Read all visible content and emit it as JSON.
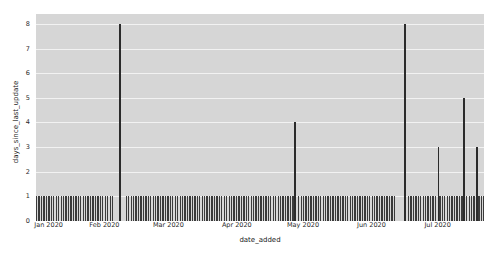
{
  "chart_data": {
    "type": "bar",
    "title": "",
    "xlabel": "date_added",
    "ylabel": "days_since_last_update",
    "grid": true,
    "legend": false,
    "ylim": [
      0,
      8.4
    ],
    "yticks": [
      0,
      1,
      2,
      3,
      4,
      5,
      6,
      7,
      8
    ],
    "ytick_labels": [
      "0",
      "1",
      "2",
      "3",
      "4",
      "5",
      "6",
      "7",
      "8"
    ],
    "xlim": [
      "2020-01-01",
      "2020-07-22"
    ],
    "xticks": [
      "2020-01-01",
      "2020-02-01",
      "2020-03-01",
      "2020-04-01",
      "2020-05-01",
      "2020-06-01",
      "2020-07-01"
    ],
    "xtick_labels": [
      "Jan 2020",
      "Feb 2020",
      "Mar 2020",
      "Apr 2020",
      "May 2020",
      "Jun 2020",
      "Jul 2020"
    ],
    "plot_background": "#d6d6d6",
    "grid_color": "#f2f2f2",
    "bar_color": "#2b2b2b",
    "baseline_value": 1,
    "daily_runs": [
      {
        "start_frac": 0.0,
        "end_frac": 0.172
      },
      {
        "start_frac": 0.2,
        "end_frac": 0.572
      },
      {
        "start_frac": 0.585,
        "end_frac": 0.8
      },
      {
        "start_frac": 0.83,
        "end_frac": 0.892
      },
      {
        "start_frac": 0.9,
        "end_frac": 0.952
      },
      {
        "start_frac": 0.96,
        "end_frac": 1.0
      }
    ],
    "spikes": [
      {
        "x_frac": 0.188,
        "value": 8,
        "date": "2020-02-05"
      },
      {
        "x_frac": 0.578,
        "value": 4,
        "date": "2020-04-06"
      },
      {
        "x_frac": 0.824,
        "value": 8,
        "date": "2020-05-27"
      },
      {
        "x_frac": 0.898,
        "value": 3,
        "date": "2020-06-15"
      },
      {
        "x_frac": 0.955,
        "value": 5,
        "date": "2020-07-01"
      },
      {
        "x_frac": 0.985,
        "value": 3,
        "date": "2020-07-13"
      }
    ],
    "values_summary": [
      1,
      8,
      1,
      4,
      1,
      8,
      3,
      5,
      3
    ]
  }
}
